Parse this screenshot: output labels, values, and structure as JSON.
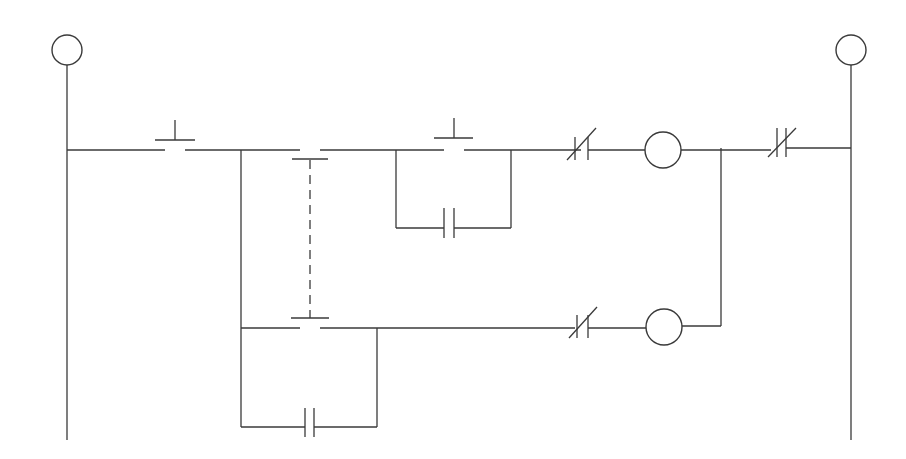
{
  "diagram": {
    "type": "ladder-logic",
    "background": "#ffffff",
    "line_color": "#3a3a3a",
    "rails": {
      "left": {
        "x": 67,
        "top": 63,
        "bottom": 440,
        "terminal_circle": {
          "cx": 67,
          "cy": 50,
          "r": 15
        }
      },
      "right": {
        "x": 851,
        "top": 63,
        "bottom": 440,
        "terminal_circle": {
          "cx": 851,
          "cy": 50,
          "r": 15
        }
      }
    },
    "rungs": [
      {
        "id": "rung-1",
        "y": 150,
        "elements": [
          {
            "type": "pushbutton-no",
            "x1": 165,
            "x2": 187
          },
          {
            "type": "pushbutton-nc-interlocked",
            "x1": 300,
            "x2": 320
          },
          {
            "type": "pushbutton-no",
            "x1": 445,
            "x2": 467,
            "seal_in": {
              "type": "contact-no",
              "x": 450,
              "y": 228
            }
          },
          {
            "type": "contact-nc",
            "x": 582
          },
          {
            "type": "coil",
            "cx": 663,
            "r": 18
          },
          {
            "type": "contact-nc",
            "x": 777
          }
        ]
      },
      {
        "id": "rung-2",
        "y": 328,
        "elements": [
          {
            "type": "pushbutton-no-interlocked",
            "x1": 300,
            "x2": 320
          },
          {
            "type": "contact-no-seal-in",
            "x": 310,
            "y": 427
          },
          {
            "type": "contact-nc",
            "x": 581
          },
          {
            "type": "coil",
            "cx": 664,
            "r": 18
          }
        ]
      }
    ],
    "mechanical_link": {
      "x": 310,
      "y1": 160,
      "y2": 318,
      "style": "dash-dot"
    }
  }
}
